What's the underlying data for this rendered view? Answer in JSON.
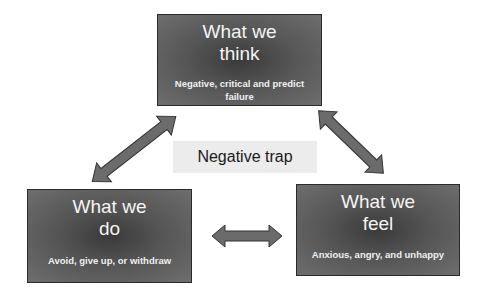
{
  "diagram": {
    "center_label": "Negative trap",
    "nodes": [
      {
        "id": "think",
        "title_line1": "What we",
        "title_line2": "think",
        "description": "Negative, critical and predict failure"
      },
      {
        "id": "do",
        "title_line1": "What we",
        "title_line2": "do",
        "description": "Avoid, give up, or withdraw"
      },
      {
        "id": "feel",
        "title_line1": "What we",
        "title_line2": "feel",
        "description": "Anxious, angry, and unhappy"
      }
    ],
    "edges": [
      {
        "from": "think",
        "to": "do",
        "type": "bidirectional-arrow"
      },
      {
        "from": "think",
        "to": "feel",
        "type": "bidirectional-arrow"
      },
      {
        "from": "do",
        "to": "feel",
        "type": "bidirectional-arrow"
      }
    ],
    "colors": {
      "box_fill": "#555555",
      "box_border": "#2a2a2a",
      "arrow_fill": "#6b6b6b",
      "arrow_stroke": "#333333",
      "label_bg": "#ececec",
      "text_on_box": "#ffffff"
    }
  }
}
